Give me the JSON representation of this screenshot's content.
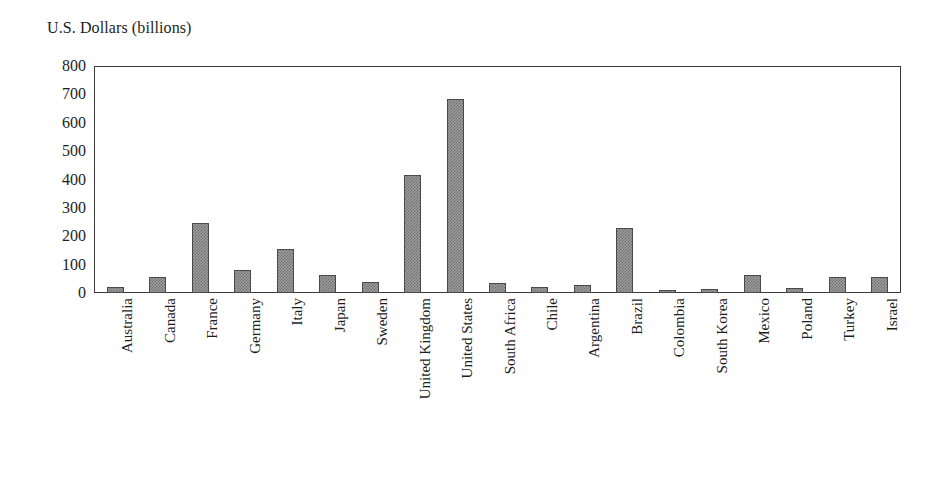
{
  "chart_data": {
    "type": "bar",
    "title": "U.S. Dollars (billions)",
    "xlabel": "",
    "ylabel": "U.S. Dollars (billions)",
    "ylim": [
      0,
      800
    ],
    "ytick_step": 100,
    "yticks": [
      0,
      100,
      200,
      300,
      400,
      500,
      600,
      700,
      800
    ],
    "ytick_labels": [
      "0",
      "100",
      "200",
      "300",
      "400",
      "500",
      "600",
      "700",
      "800"
    ],
    "grid": false,
    "legend": "none",
    "bar_fill": "#9d9d9d",
    "bar_edge": "#4a4a4a",
    "axis_color": "#3a3a3a",
    "categories": [
      "Australia",
      "Canada",
      "France",
      "Germany",
      "Italy",
      "Japan",
      "Sweden",
      "United Kingdom",
      "United States",
      "South Africa",
      "Chile",
      "Argentina",
      "Brazil",
      "Colombia",
      "South Korea",
      "Mexico",
      "Poland",
      "Turkey",
      "Israel"
    ],
    "values": [
      20,
      58,
      245,
      80,
      155,
      63,
      40,
      415,
      685,
      35,
      22,
      30,
      230,
      12,
      14,
      62,
      16,
      55,
      58
    ]
  }
}
